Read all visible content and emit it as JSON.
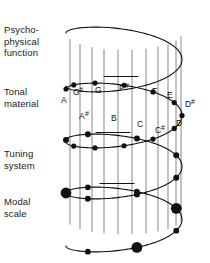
{
  "figure": {
    "background": "#ffffff",
    "stroke_color": "#111111"
  },
  "layers": [
    {
      "id": "psychophysical-function",
      "label": "Psycho-\nphysical\nfunction"
    },
    {
      "id": "tonal-material",
      "label": "Tonal\nmaterial"
    },
    {
      "id": "tuning-system",
      "label": "Tuning\nsystem"
    },
    {
      "id": "modal-scale",
      "label": "Modal\nscale"
    }
  ],
  "notes": [
    {
      "name": "A",
      "sharp": "",
      "x": 61,
      "y": 103
    },
    {
      "name": "G",
      "sharp": "#",
      "x": 73,
      "y": 95
    },
    {
      "name": "G",
      "sharp": "",
      "x": 95,
      "y": 93
    },
    {
      "name": "F",
      "sharp": "#",
      "x": 119,
      "y": 91
    },
    {
      "name": "F",
      "sharp": "",
      "x": 152,
      "y": 94
    },
    {
      "name": "E",
      "sharp": "",
      "x": 167,
      "y": 98
    },
    {
      "name": "D",
      "sharp": "#",
      "x": 185,
      "y": 107
    },
    {
      "name": "D",
      "sharp": "",
      "x": 176,
      "y": 126
    },
    {
      "name": "C",
      "sharp": "#",
      "x": 155,
      "y": 133
    },
    {
      "name": "C",
      "sharp": "",
      "x": 137,
      "y": 127
    },
    {
      "name": "B",
      "sharp": "",
      "x": 111,
      "y": 121
    },
    {
      "name": "A",
      "sharp": "#",
      "x": 79,
      "y": 119
    }
  ],
  "chart_data": {
    "type": "line",
    "turns": 4,
    "helix": {
      "center_x": 124,
      "radius_x": 58,
      "radius_y": 17,
      "turn_tops": [
        33,
        89,
        140,
        193
      ],
      "turn_pitch": 53
    },
    "vertical_lines_x": [
      70,
      80,
      92,
      104,
      118,
      132,
      146,
      158,
      168,
      176,
      181
    ],
    "markers": {
      "tonal_material": {
        "count": 12,
        "radius": 2.6
      },
      "tuning_system": {
        "count": 7,
        "radius": 3.0
      },
      "modal_scale": {
        "count": 7,
        "radius": 4.2
      }
    }
  }
}
